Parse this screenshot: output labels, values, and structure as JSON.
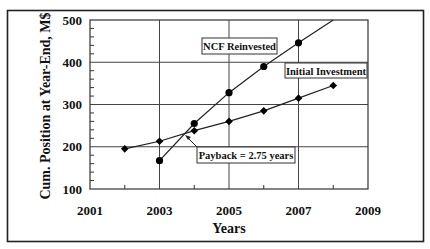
{
  "chart_data": {
    "type": "line",
    "title": "",
    "xlabel": "Years",
    "ylabel": "Cum. Position at Year-End, M$",
    "xlim": [
      2001,
      2009
    ],
    "ylim": [
      100,
      500
    ],
    "x_ticks": [
      "2001",
      "2003",
      "2005",
      "2007",
      "2009"
    ],
    "y_ticks": [
      "100",
      "200",
      "300",
      "400",
      "500"
    ],
    "grid": true,
    "legend": "inline labels",
    "series": [
      {
        "name": "NCF Reinvested",
        "x": [
          2003,
          2004,
          2005,
          2006,
          2007,
          2008
        ],
        "values": [
          167,
          255,
          328,
          390,
          446,
          500
        ],
        "markers": [
          true,
          true,
          true,
          true,
          true,
          false
        ]
      },
      {
        "name": "Initial Investment",
        "x": [
          2002,
          2003,
          2004,
          2005,
          2006,
          2007,
          2008
        ],
        "values": [
          195,
          213,
          238,
          260,
          285,
          315,
          345
        ],
        "markers": [
          true,
          true,
          true,
          true,
          true,
          true,
          true
        ]
      }
    ],
    "annotations": [
      {
        "text": "Payback = 2.75 years",
        "points_to": [
          2003.75,
          228
        ]
      }
    ]
  },
  "labels": {
    "ncf": "NCF Reinvested",
    "initial": "Initial Investment",
    "payback": "Payback = 2.75 years",
    "xlabel": "Years",
    "ylabel": "Cum. Position at Year-End, M$"
  }
}
